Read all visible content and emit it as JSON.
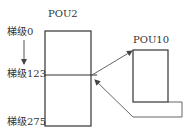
{
  "diagram": {
    "pou_main": {
      "label": "POU2"
    },
    "pou_sub": {
      "label": "POU10"
    },
    "rungs": [
      {
        "label": "梯级0"
      },
      {
        "label": "梯级123"
      },
      {
        "label": "梯级275"
      }
    ],
    "colors": {
      "line": "#333333",
      "thin_line": "#555555",
      "background": "#ffffff"
    }
  }
}
